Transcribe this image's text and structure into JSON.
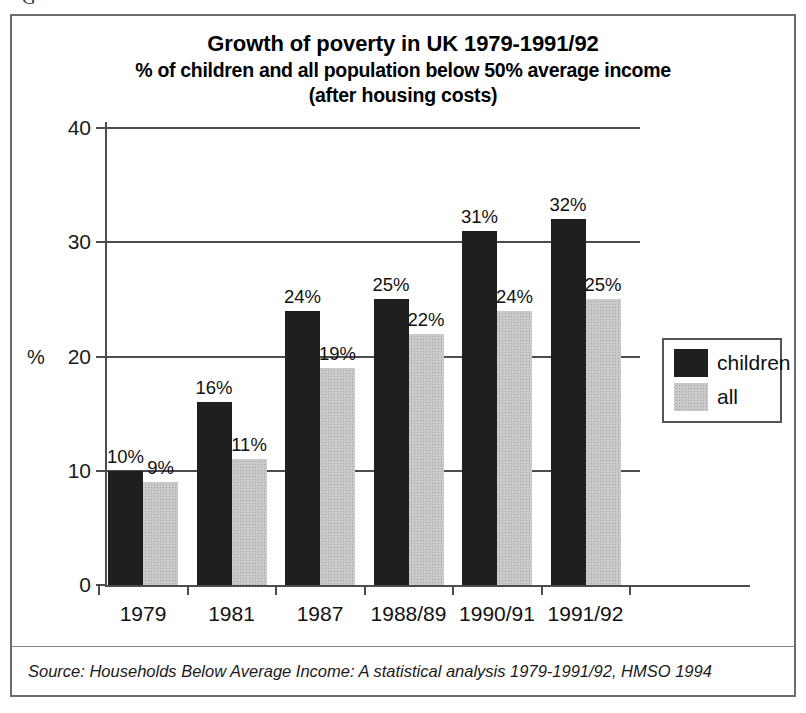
{
  "page_crumb": "G",
  "chart_data": {
    "type": "bar",
    "title": "Growth of poverty in UK 1979-1991/92",
    "subtitle": "% of children and all population below 50% average income",
    "subtitle2": "(after housing costs)",
    "xlabel": "",
    "ylabel": "%",
    "ylim": [
      0,
      40
    ],
    "yticks": [
      0,
      10,
      20,
      30,
      40
    ],
    "ytick_labels": [
      "0",
      "10",
      "20",
      "30",
      "40"
    ],
    "grid": true,
    "legend_position": "right",
    "categories": [
      "1979",
      "1981",
      "1987",
      "1988/89",
      "1990/91",
      "1991/92"
    ],
    "series": [
      {
        "name": "children",
        "color": "#1f1f1f",
        "values": [
          10,
          16,
          24,
          25,
          31,
          32
        ],
        "labels": [
          "10%",
          "16%",
          "24%",
          "25%",
          "31%",
          "32%"
        ]
      },
      {
        "name": "all",
        "color": "#c9c9c9",
        "values": [
          9,
          11,
          19,
          22,
          24,
          25
        ],
        "labels": [
          "9%",
          "11%",
          "19%",
          "22%",
          "24%",
          "25%"
        ]
      }
    ],
    "source": "Source: Households Below Average Income: A statistical analysis 1979-1991/92, HMSO 1994"
  }
}
